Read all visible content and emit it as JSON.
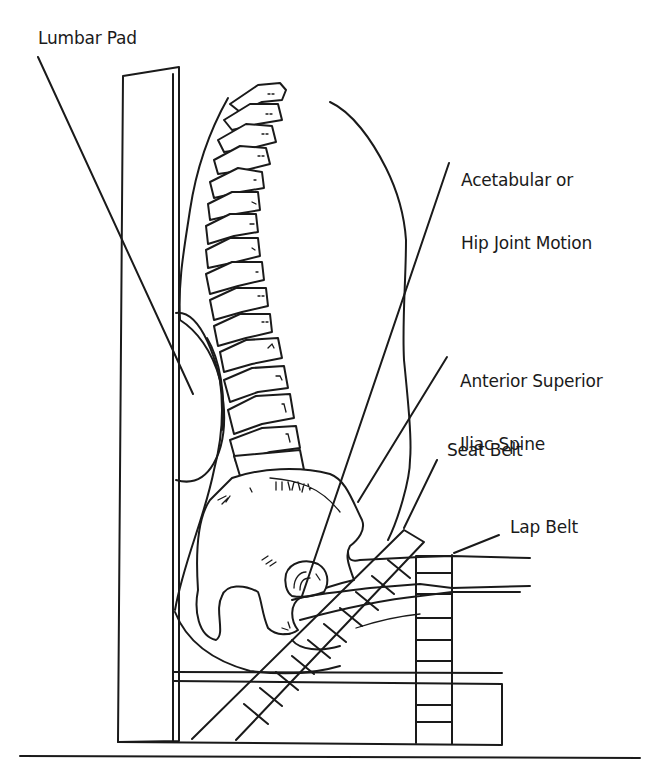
{
  "figure": {
    "type": "anatomical line diagram",
    "stroke_color": "#1a1a1a",
    "background_color": "#ffffff"
  },
  "labels": {
    "lumbar_pad": "Lumbar Pad",
    "acetabular_line1": "Acetabular or",
    "acetabular_line2": "Hip Joint Motion",
    "asis_line1": "Anterior Superior",
    "asis_line2": "Iliac Spine",
    "seat_belt": "Seat Belt",
    "lap_belt": "Lap Belt"
  },
  "components": [
    "seat-backrest",
    "lumbar-pad",
    "lumbar-spine",
    "sacrum",
    "pelvis",
    "femoral-head",
    "thigh",
    "seat-belt",
    "lap-belt",
    "seat-base",
    "floor-line"
  ]
}
